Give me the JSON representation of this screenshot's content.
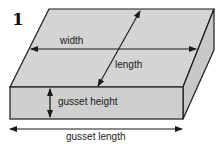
{
  "figure": {
    "number": "1",
    "labels": {
      "width": "width",
      "length": "length",
      "gusset_height": "gusset height",
      "gusset_length": "gusset length"
    },
    "colors": {
      "face": "#cfcfcf",
      "top_face": "#d4d4d4",
      "side_face": "#c8c8c8",
      "stroke": "#1a1a1a"
    }
  }
}
